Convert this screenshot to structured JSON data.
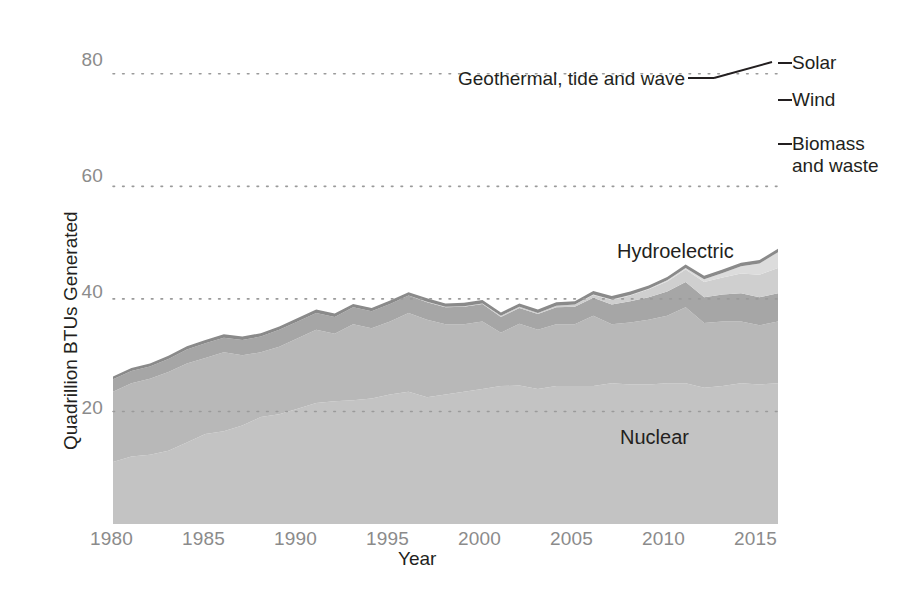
{
  "axes": {
    "y_title": "Quadrillion BTUs Generated",
    "x_title": "Year",
    "y_ticks": [
      "20",
      "40",
      "60",
      "80"
    ],
    "x_ticks": [
      "1980",
      "1985",
      "1990",
      "1995",
      "2000",
      "2005",
      "2010",
      "2015"
    ]
  },
  "labels": {
    "nuclear": "Nuclear",
    "hydroelectric": "Hydroelectric",
    "geothermal": "Geothermal, tide and wave",
    "solar": "Solar",
    "wind": "Wind",
    "biomass": "Biomass and waste"
  },
  "colors": {
    "nuclear": "#c3c3c3",
    "hydroelectric": "#b8b8b8",
    "biomass": "#a6a6a6",
    "wind": "#cfcfcf",
    "solar": "#dcdcdc",
    "geothermal": "#8a8a8a",
    "gridline": "#9a9a9a",
    "text": "#231f20",
    "tick_text": "#8b8b8b"
  },
  "chart_data": {
    "type": "area",
    "title": "",
    "xlabel": "Year",
    "ylabel": "Quadrillion BTUs Generated",
    "xlim": [
      1980,
      2016
    ],
    "ylim": [
      0,
      86
    ],
    "grid": true,
    "stacked": true,
    "legend_position": "right-inline",
    "x": [
      1980,
      1981,
      1982,
      1983,
      1984,
      1985,
      1986,
      1987,
      1988,
      1989,
      1990,
      1991,
      1992,
      1993,
      1994,
      1995,
      1996,
      1997,
      1998,
      1999,
      2000,
      2001,
      2002,
      2003,
      2004,
      2005,
      2006,
      2007,
      2008,
      2009,
      2010,
      2011,
      2012,
      2013,
      2014,
      2015,
      2016
    ],
    "series": [
      {
        "name": "Nuclear",
        "values": [
          11.0,
          12.0,
          12.3,
          13.0,
          14.5,
          16.0,
          16.5,
          17.5,
          19.0,
          19.5,
          20.5,
          21.5,
          21.8,
          22.0,
          22.3,
          23.0,
          23.5,
          22.5,
          23.0,
          23.5,
          24.0,
          24.5,
          24.6,
          24.0,
          24.5,
          24.5,
          24.5,
          25.0,
          24.8,
          24.8,
          25.0,
          25.0,
          24.2,
          24.5,
          25.0,
          24.8,
          25.0
        ]
      },
      {
        "name": "Hydroelectric",
        "values": [
          12.5,
          13.0,
          13.5,
          14.0,
          14.0,
          13.5,
          14.0,
          12.5,
          11.5,
          12.0,
          12.5,
          13.0,
          12.0,
          13.5,
          12.5,
          13.0,
          14.0,
          13.8,
          12.5,
          12.0,
          12.0,
          9.5,
          11.0,
          10.5,
          11.0,
          11.0,
          12.5,
          10.5,
          11.0,
          11.5,
          12.0,
          13.5,
          11.5,
          11.5,
          11.0,
          10.5,
          11.0
        ]
      },
      {
        "name": "Biomass and waste",
        "values": [
          2.2,
          2.2,
          2.2,
          2.3,
          2.5,
          2.6,
          2.6,
          2.7,
          2.8,
          3.0,
          3.0,
          3.0,
          3.0,
          3.0,
          3.0,
          3.1,
          3.1,
          3.1,
          3.0,
          3.1,
          3.1,
          2.8,
          2.8,
          2.8,
          3.0,
          3.1,
          3.2,
          3.5,
          3.8,
          4.0,
          4.3,
          4.5,
          4.6,
          4.8,
          5.0,
          5.0,
          5.0
        ]
      },
      {
        "name": "Wind",
        "values": [
          0.0,
          0.0,
          0.0,
          0.0,
          0.0,
          0.0,
          0.0,
          0.0,
          0.0,
          0.0,
          0.0,
          0.0,
          0.0,
          0.0,
          0.0,
          0.0,
          0.0,
          0.1,
          0.1,
          0.1,
          0.1,
          0.2,
          0.2,
          0.2,
          0.3,
          0.4,
          0.5,
          0.8,
          1.0,
          1.4,
          1.8,
          2.2,
          2.7,
          3.0,
          3.5,
          4.0,
          4.5
        ]
      },
      {
        "name": "Solar",
        "values": [
          0.0,
          0.0,
          0.0,
          0.0,
          0.0,
          0.0,
          0.0,
          0.0,
          0.0,
          0.0,
          0.0,
          0.0,
          0.0,
          0.0,
          0.0,
          0.0,
          0.0,
          0.0,
          0.0,
          0.0,
          0.0,
          0.0,
          0.0,
          0.0,
          0.0,
          0.0,
          0.1,
          0.1,
          0.1,
          0.1,
          0.2,
          0.3,
          0.5,
          0.8,
          1.3,
          2.0,
          2.8
        ]
      },
      {
        "name": "Geothermal, tide and wave",
        "values": [
          0.5,
          0.5,
          0.5,
          0.6,
          0.6,
          0.6,
          0.6,
          0.6,
          0.6,
          0.6,
          0.6,
          0.6,
          0.6,
          0.6,
          0.6,
          0.6,
          0.6,
          0.6,
          0.6,
          0.6,
          0.6,
          0.6,
          0.6,
          0.6,
          0.6,
          0.6,
          0.6,
          0.6,
          0.6,
          0.6,
          0.6,
          0.6,
          0.6,
          0.6,
          0.6,
          0.6,
          0.6
        ]
      }
    ]
  }
}
